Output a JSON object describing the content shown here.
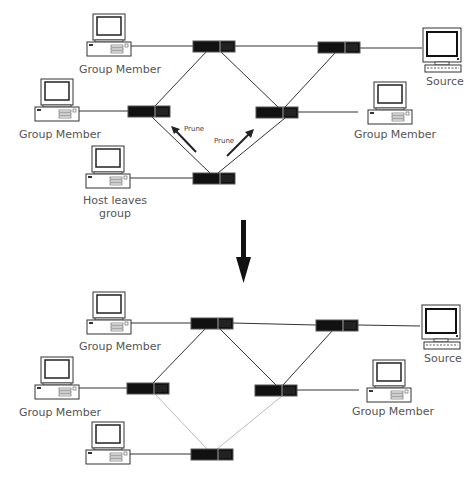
{
  "diagram": {
    "top_panel": {
      "labels": {
        "member_top_left": "Group Member",
        "member_mid_left": "Group Member",
        "member_right": "Group Member",
        "source": "Source",
        "leaving_host": "Host leaves\ngroup",
        "leaving_host_line1": "Host leaves",
        "leaving_host_line2": "group",
        "prune_left": "Prune",
        "prune_right": "Prune"
      }
    },
    "bottom_panel": {
      "labels": {
        "member_top_left": "Group Member",
        "member_mid_left": "Group Member",
        "member_right": "Group Member",
        "source": "Source"
      },
      "pruned_links_style": "faint"
    },
    "transition_arrow": "down-arrow",
    "colors": {
      "line": "#333333",
      "router": "#111111",
      "pruned_link": "#bbbbbb",
      "label": "#555555"
    }
  }
}
